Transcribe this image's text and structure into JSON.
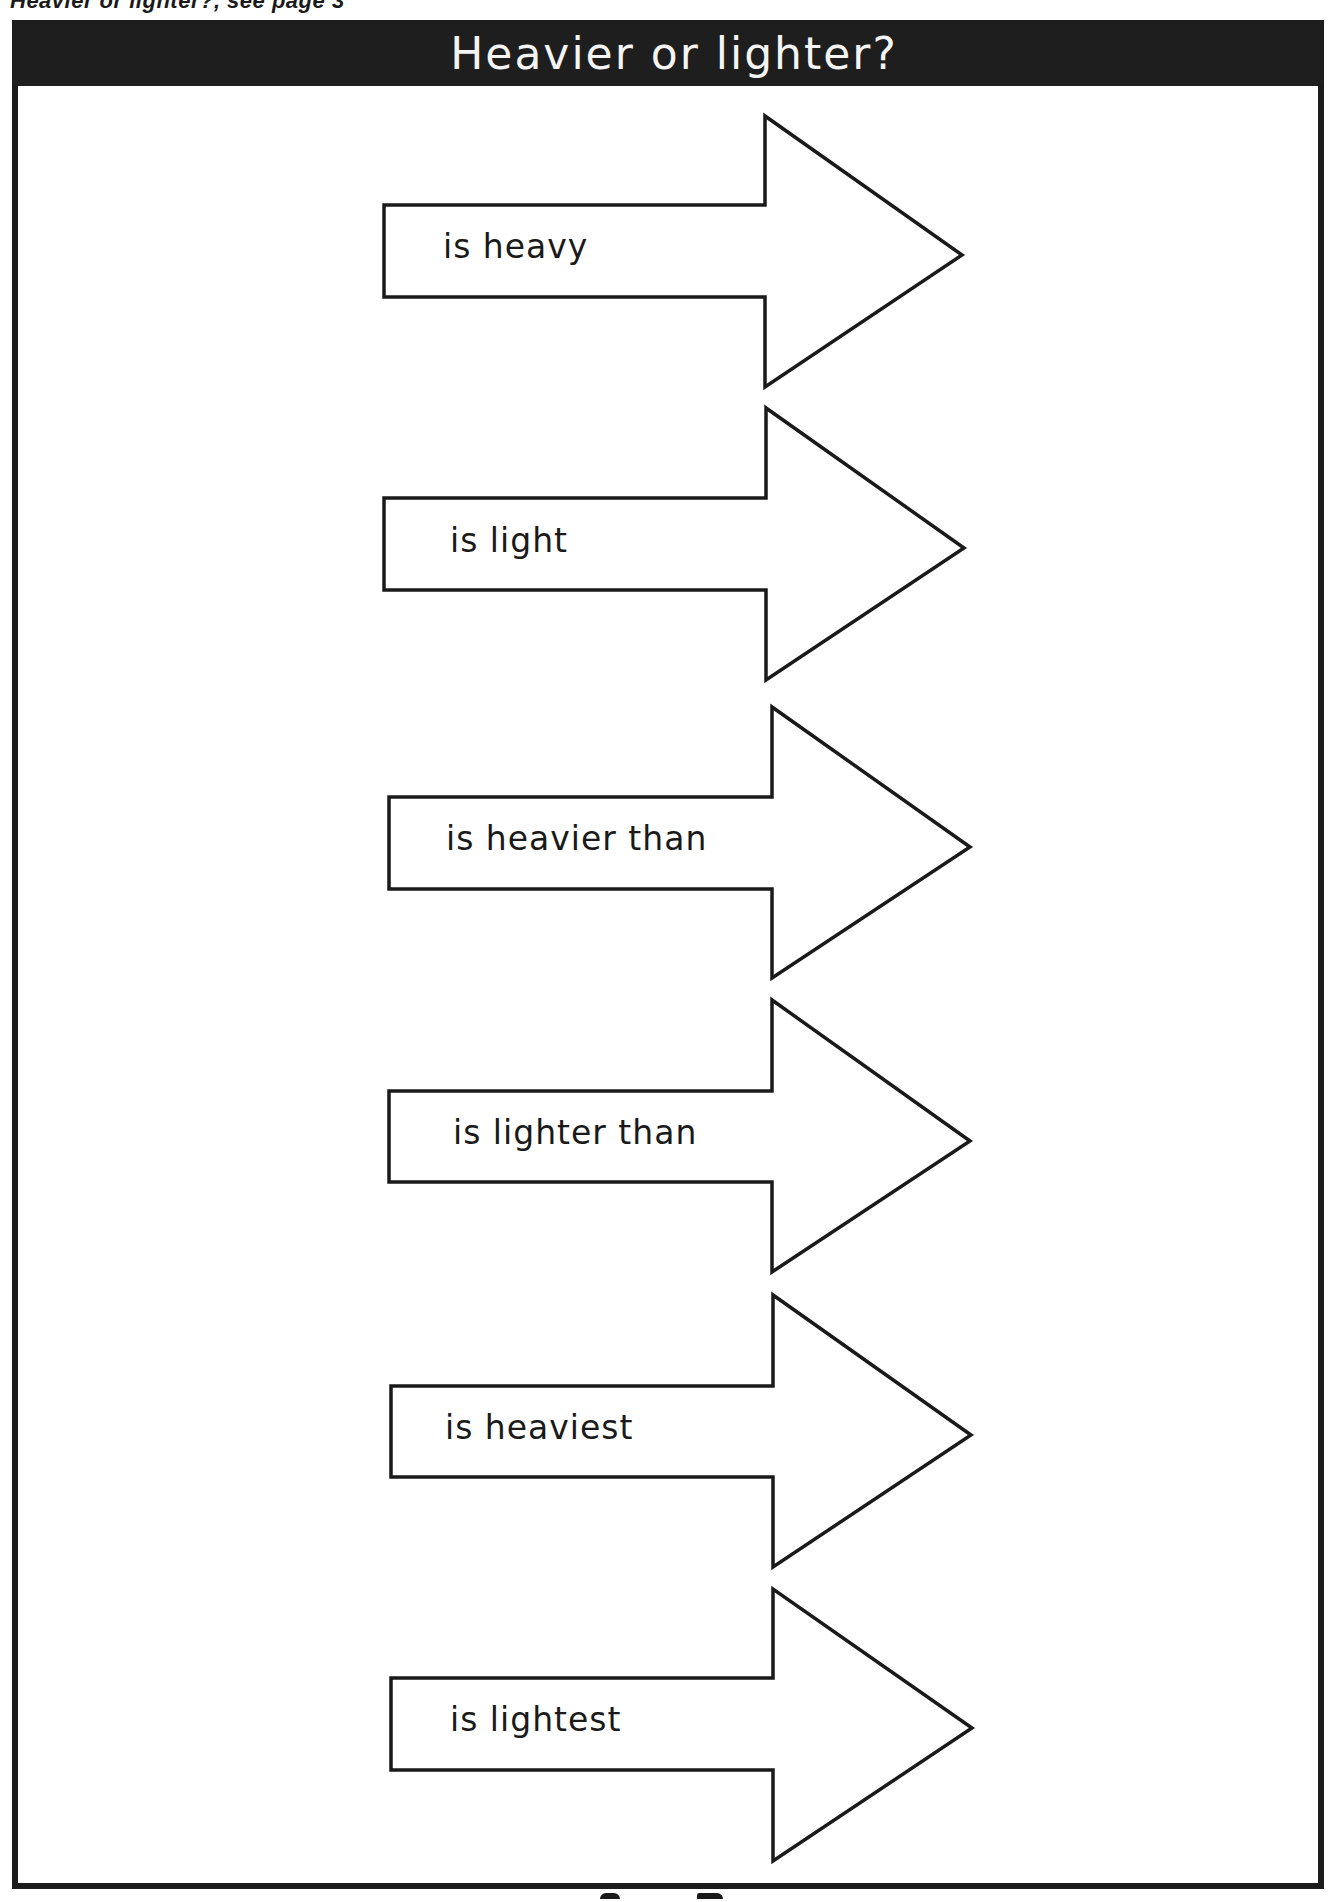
{
  "page": {
    "running_head": "Heavier or lighter?, see page 3"
  },
  "worksheet": {
    "title": "Heavier or lighter?",
    "arrows": [
      {
        "label": "is heavy"
      },
      {
        "label": "is light"
      },
      {
        "label": "is heavier than"
      },
      {
        "label": "is lighter than"
      },
      {
        "label": "is heaviest"
      },
      {
        "label": "is lightest"
      }
    ]
  },
  "colors": {
    "title_bar": "#1e1e1e",
    "title_text": "#f4f4f4",
    "outline": "#1a1a1a",
    "background": "#ffffff"
  }
}
